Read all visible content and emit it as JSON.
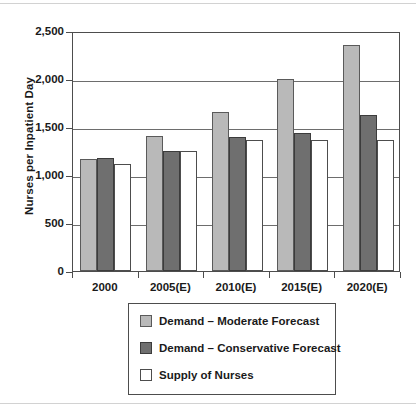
{
  "chart_data": {
    "type": "bar",
    "title": "",
    "xlabel": "",
    "ylabel": "Nurses per Inpatient Day",
    "categories": [
      "2000",
      "2005(E)",
      "2010(E)",
      "2015(E)",
      "2020(E)"
    ],
    "series": [
      {
        "name": "Demand – Moderate Forecast",
        "color": "#b9b9b9",
        "values": [
          1170,
          1405,
          1655,
          2000,
          2350
        ]
      },
      {
        "name": "Demand – Conservative Forecast",
        "color": "#6f6f6f",
        "values": [
          1175,
          1255,
          1400,
          1440,
          1625
        ]
      },
      {
        "name": "Supply of Nurses",
        "color": "#ffffff",
        "values": [
          1110,
          1255,
          1360,
          1360,
          1360
        ]
      }
    ],
    "ylim": [
      0,
      2500
    ],
    "yticks": [
      0,
      500,
      1000,
      1500,
      2000,
      2500
    ],
    "ytick_labels": [
      "0",
      "500",
      "1,000",
      "1,500",
      "2,000",
      "2,500"
    ],
    "grid": true,
    "legend_position": "bottom-center"
  },
  "legend": {
    "items": [
      {
        "label": "Demand – Moderate Forecast"
      },
      {
        "label": "Demand – Conservative Forecast"
      },
      {
        "label": "Supply of Nurses"
      }
    ]
  }
}
